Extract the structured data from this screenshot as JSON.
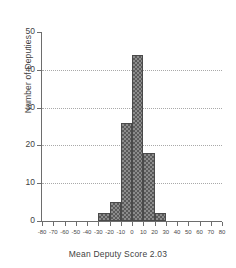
{
  "chart_data": {
    "type": "bar",
    "title": "",
    "xlabel": "Mean Deputy Score 2.03",
    "ylabel": "Number of Deputies",
    "xlim": [
      -80,
      80
    ],
    "ylim": [
      0,
      50
    ],
    "grid": true,
    "legend": null,
    "xticks": [
      -80,
      -70,
      -60,
      -50,
      -40,
      -30,
      -20,
      -10,
      0,
      10,
      20,
      30,
      40,
      50,
      60,
      70,
      80
    ],
    "xtick_labels": [
      "-80",
      "-70",
      "-60",
      "-50",
      "-40",
      "-30",
      "-20",
      "-10",
      "0",
      "10",
      "20",
      "30",
      "40",
      "50",
      "60",
      "70",
      "80"
    ],
    "yticks": [
      0,
      10,
      20,
      30,
      40,
      50
    ],
    "ytick_labels": [
      "0",
      "10",
      "20",
      "30",
      "40",
      "50"
    ],
    "gridlines_y": [
      10,
      20,
      30,
      40
    ],
    "bin_width": 10,
    "bins": [
      {
        "start": -30,
        "end": -20,
        "value": 2
      },
      {
        "start": -20,
        "end": -10,
        "value": 5
      },
      {
        "start": -10,
        "end": 0,
        "value": 26
      },
      {
        "start": 0,
        "end": 10,
        "value": 44
      },
      {
        "start": 10,
        "end": 20,
        "value": 18
      },
      {
        "start": 20,
        "end": 30,
        "value": 2
      }
    ],
    "categories": [
      "-30",
      "-20",
      "-10",
      "0",
      "10",
      "20"
    ],
    "values": [
      2,
      5,
      26,
      44,
      18,
      2
    ],
    "bar_fill_color": "#8c8c8c",
    "bar_edge_color": "#4a4a4a",
    "axis_color": "#6d6d6d",
    "grid_color": "#a9a9a9"
  }
}
